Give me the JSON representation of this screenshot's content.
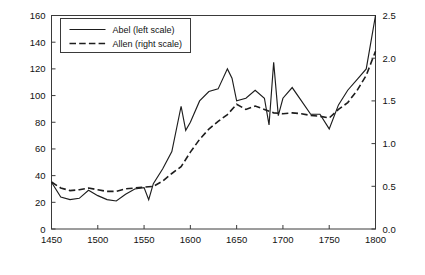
{
  "chart_data": {
    "type": "line",
    "title": "",
    "xlabel": "",
    "ylabel": "Wheat, g silver per 100 kg",
    "ylabel_right": "CPI",
    "xlim": [
      1450,
      1800
    ],
    "ylim": [
      0,
      160
    ],
    "ylim_right": [
      0.0,
      2.5
    ],
    "xticks": [
      1450,
      1500,
      1550,
      1600,
      1650,
      1700,
      1750,
      1800
    ],
    "xticklabels": [
      "1450",
      "1500",
      "1550",
      "1600",
      "1650",
      "1700",
      "1750",
      "1800"
    ],
    "yticks": [
      0,
      20,
      40,
      60,
      80,
      100,
      120,
      140,
      160
    ],
    "yticklabels": [
      "0",
      "20",
      "40",
      "60",
      "80",
      "100",
      "120",
      "140",
      "160"
    ],
    "yticks_right": [
      0.0,
      0.5,
      1.0,
      1.5,
      2.0,
      2.5
    ],
    "yticklabels_right": [
      "0.0",
      "0.5",
      "1.0",
      "1.5",
      "2.0",
      "2.5"
    ],
    "grid": false,
    "legend_position": "upper left",
    "legend": [
      "Abel (left scale)",
      "Allen (right scale)"
    ],
    "series": [
      {
        "name": "Abel (left scale)",
        "axis": "left",
        "style": "solid",
        "x": [
          1450,
          1460,
          1470,
          1480,
          1490,
          1500,
          1510,
          1520,
          1530,
          1540,
          1550,
          1555,
          1560,
          1570,
          1580,
          1590,
          1595,
          1600,
          1610,
          1620,
          1630,
          1640,
          1645,
          1650,
          1660,
          1670,
          1680,
          1685,
          1690,
          1695,
          1700,
          1710,
          1720,
          1730,
          1740,
          1750,
          1760,
          1770,
          1780,
          1790,
          1800
        ],
        "y": [
          35,
          24,
          22,
          23,
          29,
          25,
          22,
          21,
          26,
          30,
          31,
          22,
          34,
          45,
          58,
          92,
          74,
          80,
          96,
          103,
          105,
          120,
          113,
          96,
          98,
          104,
          98,
          78,
          125,
          85,
          98,
          106,
          96,
          86,
          86,
          75,
          93,
          104,
          112,
          120,
          160
        ]
      },
      {
        "name": "Allen (right scale)",
        "axis": "right",
        "style": "dashed",
        "x": [
          1450,
          1460,
          1470,
          1480,
          1490,
          1500,
          1510,
          1520,
          1530,
          1540,
          1550,
          1560,
          1570,
          1580,
          1590,
          1600,
          1610,
          1620,
          1630,
          1640,
          1650,
          1660,
          1670,
          1680,
          1690,
          1700,
          1710,
          1720,
          1730,
          1740,
          1750,
          1760,
          1770,
          1780,
          1790,
          1800
        ],
        "y_cpi": [
          0.55,
          0.48,
          0.45,
          0.46,
          0.48,
          0.46,
          0.44,
          0.44,
          0.47,
          0.48,
          0.49,
          0.5,
          0.56,
          0.65,
          0.73,
          0.9,
          1.05,
          1.17,
          1.26,
          1.34,
          1.46,
          1.4,
          1.44,
          1.4,
          1.36,
          1.35,
          1.36,
          1.35,
          1.33,
          1.32,
          1.3,
          1.4,
          1.48,
          1.62,
          1.8,
          2.08
        ]
      }
    ]
  }
}
